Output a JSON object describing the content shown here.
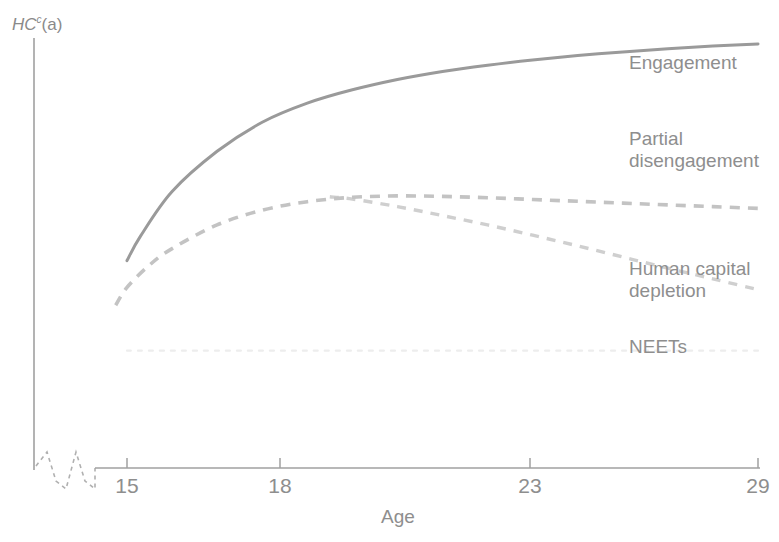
{
  "chart_data": {
    "type": "line",
    "title": "",
    "xlabel": "Age",
    "ylabel": "HC",
    "ylabel_superscript": "c",
    "ylabel_suffix": "(a)",
    "xlim": [
      15,
      29
    ],
    "ylim": [
      0,
      1
    ],
    "grid": false,
    "legend_position": "right-inline",
    "x_ticks": [
      {
        "value": 15,
        "label": "15",
        "px": 127
      },
      {
        "value": 18,
        "label": "18",
        "px": 280
      },
      {
        "value": 23,
        "label": "23",
        "px": 530
      },
      {
        "value": 29,
        "label": "29",
        "px": 758
      }
    ],
    "y_ticks": [],
    "axis_break": {
      "present": true,
      "type": "zigzag",
      "axis": "x"
    },
    "series": [
      {
        "name": "Engagement",
        "style": "solid",
        "color": "#9a9a9a",
        "x": [
          15,
          15.3,
          16,
          17,
          18,
          19,
          20,
          21,
          22,
          23,
          24,
          25,
          26,
          27,
          28,
          29
        ],
        "values": [
          0.465,
          0.52,
          0.62,
          0.71,
          0.775,
          0.818,
          0.848,
          0.871,
          0.889,
          0.903,
          0.915,
          0.925,
          0.933,
          0.94,
          0.946,
          0.951
        ]
      },
      {
        "name": "Partial disengagement",
        "style": "dashed",
        "color": "#c3c3c3",
        "x": [
          14.75,
          15,
          15.5,
          16,
          17,
          18,
          19,
          20,
          21,
          22,
          23,
          24,
          25,
          26,
          27,
          28,
          29
        ],
        "values": [
          0.365,
          0.405,
          0.455,
          0.492,
          0.545,
          0.578,
          0.597,
          0.607,
          0.61,
          0.609,
          0.606,
          0.602,
          0.598,
          0.594,
          0.59,
          0.586,
          0.582
        ]
      },
      {
        "name": "Human capital depletion",
        "style": "dashed",
        "color": "#cfcfcf",
        "x": [
          19.5,
          20,
          21,
          22,
          23,
          24,
          25,
          26,
          27,
          28,
          29
        ],
        "values": [
          0.608,
          0.603,
          0.586,
          0.566,
          0.545,
          0.522,
          0.498,
          0.473,
          0.448,
          0.424,
          0.4
        ]
      },
      {
        "name": "NEETs",
        "style": "dotted",
        "color": "#ededed",
        "x": [
          15,
          29
        ],
        "values": [
          0.263,
          0.263
        ]
      }
    ],
    "annotations": [
      {
        "text": "Engagement",
        "series": "Engagement"
      },
      {
        "text": "Partial\ndisengagement",
        "series": "Partial disengagement"
      },
      {
        "text": "Human capital\ndepletion",
        "series": "Human capital depletion"
      },
      {
        "text": "NEETs",
        "series": "NEETs"
      }
    ]
  },
  "axes": {
    "y_label_main": "HC",
    "y_label_sup": "c",
    "y_label_arg": "(a)",
    "x_label": "Age"
  },
  "ticks": {
    "t15": "15",
    "t18": "18",
    "t23": "23",
    "t29": "29"
  },
  "series_labels": {
    "engagement": "Engagement",
    "partial_line1": "Partial",
    "partial_line2": "disengagement",
    "depletion_line1": "Human capital",
    "depletion_line2": "depletion",
    "neets": "NEETs"
  },
  "colors": {
    "engagement": "#9a9a9a",
    "partial": "#c3c3c3",
    "depletion": "#cfcfcf",
    "neets": "#ededed",
    "axis": "#9c9c9c",
    "text": "#8e8e8e"
  }
}
